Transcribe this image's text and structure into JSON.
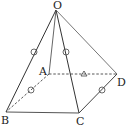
{
  "diagram": {
    "vertices": {
      "O": {
        "label": "O",
        "x": 56,
        "y": 10,
        "lx": 53,
        "ly": 9
      },
      "A": {
        "label": "A",
        "x": 49,
        "y": 74,
        "lx": 39,
        "ly": 75
      },
      "B": {
        "label": "B",
        "x": 6,
        "y": 112,
        "lx": 1,
        "ly": 124
      },
      "C": {
        "label": "C",
        "x": 79,
        "y": 113,
        "lx": 76,
        "ly": 125
      },
      "D": {
        "label": "D",
        "x": 117,
        "y": 74,
        "lx": 117,
        "ly": 86
      }
    },
    "edges": [
      {
        "from": "O",
        "to": "B",
        "style": "solid"
      },
      {
        "from": "O",
        "to": "A",
        "style": "solid"
      },
      {
        "from": "O",
        "to": "C",
        "style": "solid"
      },
      {
        "from": "O",
        "to": "D",
        "style": "solid"
      },
      {
        "from": "B",
        "to": "C",
        "style": "solid"
      },
      {
        "from": "C",
        "to": "D",
        "style": "solid"
      },
      {
        "from": "A",
        "to": "B",
        "style": "dashed"
      },
      {
        "from": "A",
        "to": "D",
        "style": "dashed"
      }
    ],
    "marks": [
      {
        "edge": "OB",
        "type": "circle"
      },
      {
        "edge": "OC",
        "type": "circle"
      },
      {
        "edge": "AB",
        "type": "circle"
      },
      {
        "edge": "CD",
        "type": "circle"
      },
      {
        "edge": "AD",
        "type": "triangle"
      }
    ],
    "colors": {
      "line": "#333333",
      "light_line": "#777777",
      "background": "#ffffff"
    }
  }
}
